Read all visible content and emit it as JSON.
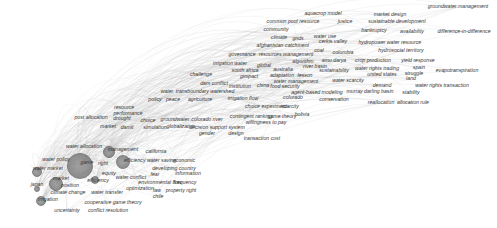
{
  "chart_data": {
    "type": "network",
    "title": "",
    "hub": "game theory",
    "nodes": [
      {
        "label": "game theory",
        "x": 80,
        "y": 166,
        "r": 12
      },
      {
        "label": "water market",
        "x": 37,
        "y": 172,
        "r": 4
      },
      {
        "label": "transboundary",
        "x": 56,
        "y": 184,
        "r": 6
      },
      {
        "label": "irrigation",
        "x": 41,
        "y": 201,
        "r": 4
      },
      {
        "label": "cooperation",
        "x": 109,
        "y": 152,
        "r": 5
      },
      {
        "label": "water allocation",
        "x": 123,
        "y": 162,
        "r": 6
      },
      {
        "label": "japan",
        "x": 37,
        "y": 189,
        "r": 2
      },
      {
        "label": "conflict",
        "x": 95,
        "y": 180,
        "r": 3
      }
    ],
    "labels": [
      {
        "text": "groundwater management",
        "x": 458,
        "y": 7
      },
      {
        "text": "aquacrop model",
        "x": 323,
        "y": 14
      },
      {
        "text": "market design",
        "x": 390,
        "y": 15
      },
      {
        "text": "common pool resource",
        "x": 293,
        "y": 22
      },
      {
        "text": "justice",
        "x": 345,
        "y": 22
      },
      {
        "text": "sustainable development",
        "x": 397,
        "y": 22
      },
      {
        "text": "community",
        "x": 276,
        "y": 30
      },
      {
        "text": "bankruptcy",
        "x": 374,
        "y": 31
      },
      {
        "text": "availability",
        "x": 412,
        "y": 32
      },
      {
        "text": "difference-in-difference",
        "x": 464,
        "y": 32
      },
      {
        "text": "climate",
        "x": 279,
        "y": 38
      },
      {
        "text": "grids",
        "x": 298,
        "y": 39
      },
      {
        "text": "water use",
        "x": 325,
        "y": 37
      },
      {
        "text": "cerkis valley",
        "x": 333,
        "y": 42
      },
      {
        "text": "hydropower",
        "x": 372,
        "y": 43
      },
      {
        "text": "water resource",
        "x": 404,
        "y": 43
      },
      {
        "text": "afghanistan",
        "x": 270,
        "y": 46
      },
      {
        "text": "catchment",
        "x": 297,
        "y": 46
      },
      {
        "text": "coal",
        "x": 319,
        "y": 51
      },
      {
        "text": "colombia",
        "x": 343,
        "y": 53
      },
      {
        "text": "hydrosocial territory",
        "x": 401,
        "y": 51
      },
      {
        "text": "governance",
        "x": 242,
        "y": 55
      },
      {
        "text": "resources management",
        "x": 286,
        "y": 55
      },
      {
        "text": "crop production",
        "x": 373,
        "y": 61
      },
      {
        "text": "yield response",
        "x": 418,
        "y": 61
      },
      {
        "text": "algorithm",
        "x": 303,
        "y": 62
      },
      {
        "text": "amu darya",
        "x": 334,
        "y": 61
      },
      {
        "text": "irrigation water",
        "x": 230,
        "y": 64
      },
      {
        "text": "global",
        "x": 264,
        "y": 66
      },
      {
        "text": "australia",
        "x": 283,
        "y": 70
      },
      {
        "text": "river basin",
        "x": 315,
        "y": 67
      },
      {
        "text": "sustainability",
        "x": 334,
        "y": 71
      },
      {
        "text": "water rights trading",
        "x": 377,
        "y": 69
      },
      {
        "text": "spain",
        "x": 419,
        "y": 68
      },
      {
        "text": "evapotranspiration",
        "x": 457,
        "y": 71
      },
      {
        "text": "south africa",
        "x": 245,
        "y": 71
      },
      {
        "text": "challenge",
        "x": 201,
        "y": 75
      },
      {
        "text": "gimpact",
        "x": 249,
        "y": 77
      },
      {
        "text": "adaptation",
        "x": 282,
        "y": 76
      },
      {
        "text": "lesson",
        "x": 305,
        "y": 76
      },
      {
        "text": "united states",
        "x": 382,
        "y": 75
      },
      {
        "text": "struggle",
        "x": 414,
        "y": 74
      },
      {
        "text": "land",
        "x": 411,
        "y": 79
      },
      {
        "text": "water management",
        "x": 296,
        "y": 82
      },
      {
        "text": "water scarcity",
        "x": 348,
        "y": 81
      },
      {
        "text": "dam conflict",
        "x": 214,
        "y": 84
      },
      {
        "text": "institution",
        "x": 240,
        "y": 87
      },
      {
        "text": "china",
        "x": 263,
        "y": 86
      },
      {
        "text": "food security",
        "x": 285,
        "y": 87
      },
      {
        "text": "demand",
        "x": 382,
        "y": 86
      },
      {
        "text": "water rights transaction",
        "x": 442,
        "y": 86
      },
      {
        "text": "agent-based modeling",
        "x": 317,
        "y": 93
      },
      {
        "text": "murray darling basin",
        "x": 370,
        "y": 92
      },
      {
        "text": "stability",
        "x": 411,
        "y": 93
      },
      {
        "text": "water",
        "x": 167,
        "y": 92
      },
      {
        "text": "transboundary watershed",
        "x": 205,
        "y": 92
      },
      {
        "text": "colorado",
        "x": 293,
        "y": 98
      },
      {
        "text": "conservation",
        "x": 334,
        "y": 100
      },
      {
        "text": "reallocation",
        "x": 381,
        "y": 103
      },
      {
        "text": "allocation rule",
        "x": 413,
        "y": 103
      },
      {
        "text": "policy",
        "x": 155,
        "y": 100
      },
      {
        "text": "peace",
        "x": 173,
        "y": 100
      },
      {
        "text": "agriculture",
        "x": 200,
        "y": 100
      },
      {
        "text": "irrigation flow",
        "x": 243,
        "y": 99
      },
      {
        "text": "resource",
        "x": 124,
        "y": 108
      },
      {
        "text": "performance",
        "x": 128,
        "y": 114
      },
      {
        "text": "choice experiment",
        "x": 266,
        "y": 107
      },
      {
        "text": "scarcity",
        "x": 290,
        "y": 107
      },
      {
        "text": "post allocation",
        "x": 91,
        "y": 118
      },
      {
        "text": "drought",
        "x": 122,
        "y": 119
      },
      {
        "text": "choice",
        "x": 148,
        "y": 121
      },
      {
        "text": "groundwater",
        "x": 175,
        "y": 120
      },
      {
        "text": "colorado river",
        "x": 207,
        "y": 120
      },
      {
        "text": "bolivia",
        "x": 302,
        "y": 115
      },
      {
        "text": "contingent ranking",
        "x": 251,
        "y": 117
      },
      {
        "text": "game theory",
        "x": 282,
        "y": 117
      },
      {
        "text": "willingness to pay",
        "x": 266,
        "y": 123
      },
      {
        "text": "market",
        "x": 108,
        "y": 127
      },
      {
        "text": "damit",
        "x": 127,
        "y": 128
      },
      {
        "text": "simulation",
        "x": 155,
        "y": 128
      },
      {
        "text": "globalization",
        "x": 181,
        "y": 127
      },
      {
        "text": "decision support system",
        "x": 217,
        "y": 128
      },
      {
        "text": "gender",
        "x": 207,
        "y": 134
      },
      {
        "text": "design",
        "x": 236,
        "y": 134
      },
      {
        "text": "transaction cost",
        "x": 262,
        "y": 139
      },
      {
        "text": "water allocation",
        "x": 84,
        "y": 147
      },
      {
        "text": "management",
        "x": 123,
        "y": 150
      },
      {
        "text": "california",
        "x": 156,
        "y": 152
      },
      {
        "text": "water policy",
        "x": 56,
        "y": 160
      },
      {
        "text": "water market",
        "x": 48,
        "y": 169
      },
      {
        "text": "game",
        "x": 87,
        "y": 163
      },
      {
        "text": "right",
        "x": 103,
        "y": 164
      },
      {
        "text": "efficiency water saving",
        "x": 150,
        "y": 161
      },
      {
        "text": "economic",
        "x": 184,
        "y": 161
      },
      {
        "text": "equity",
        "x": 109,
        "y": 174
      },
      {
        "text": "developing country",
        "x": 174,
        "y": 169
      },
      {
        "text": "information",
        "x": 188,
        "y": 174
      },
      {
        "text": "market",
        "x": 61,
        "y": 179
      },
      {
        "text": "efficiency",
        "x": 98,
        "y": 181
      },
      {
        "text": "water conflict",
        "x": 131,
        "y": 178
      },
      {
        "text": "fear",
        "x": 155,
        "y": 175
      },
      {
        "text": "japan",
        "x": 37,
        "y": 185
      },
      {
        "text": "position",
        "x": 70,
        "y": 186
      },
      {
        "text": "environmental flow",
        "x": 160,
        "y": 183
      },
      {
        "text": "frequency",
        "x": 185,
        "y": 183
      },
      {
        "text": "climate change",
        "x": 68,
        "y": 193
      },
      {
        "text": "water transfer",
        "x": 107,
        "y": 193
      },
      {
        "text": "optimization",
        "x": 140,
        "y": 189
      },
      {
        "text": "law",
        "x": 157,
        "y": 191
      },
      {
        "text": "property right",
        "x": 181,
        "y": 191
      },
      {
        "text": "chile",
        "x": 158,
        "y": 197
      },
      {
        "text": "irrigation",
        "x": 48,
        "y": 200
      },
      {
        "text": "cooperative game theory",
        "x": 113,
        "y": 203
      },
      {
        "text": "uncertainty",
        "x": 67,
        "y": 211
      },
      {
        "text": "conflict resolution",
        "x": 108,
        "y": 211
      }
    ],
    "colors": {
      "background": "#ffffff",
      "edges": "#bdbdbd",
      "nodes": "#6f6f6f",
      "labels": "#3a3a3a"
    }
  }
}
